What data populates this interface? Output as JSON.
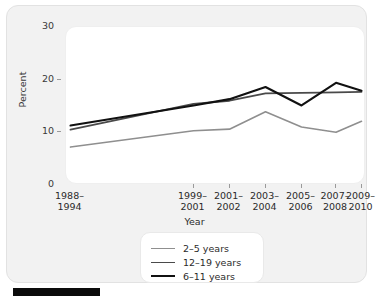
{
  "chart_data": {
    "type": "line",
    "title": "",
    "xlabel": "Year",
    "ylabel": "Percent",
    "ylim": [
      0,
      30
    ],
    "yticks": [
      0,
      10,
      20,
      30
    ],
    "ytick_labels": [
      "0",
      "10",
      "20",
      "30"
    ],
    "grid": false,
    "legend_position": "bottom-center",
    "categories": [
      "1988–1994",
      "1999–2001",
      "2001–2002",
      "2003–2004",
      "2005–2006",
      "2007–2008",
      "2009–2010"
    ],
    "category_lines": [
      [
        "1988–",
        "1994"
      ],
      [
        "1999–",
        "2001"
      ],
      [
        "2001–",
        "2002"
      ],
      [
        "2003–",
        "2004"
      ],
      [
        "2005–",
        "2006"
      ],
      [
        "2007–",
        "2008"
      ],
      [
        "2009–",
        "2010"
      ]
    ],
    "category_x_frac": [
      0.015,
      0.425,
      0.545,
      0.665,
      0.785,
      0.9,
      0.985
    ],
    "series": [
      {
        "name": "2–5 years",
        "color": "#8f8f8f",
        "width": 1.6,
        "values": [
          7.2,
          10.3,
          10.6,
          13.9,
          11.0,
          10.0,
          12.1
        ]
      },
      {
        "name": "12–19 years",
        "color": "#4a4a4a",
        "width": 1.8,
        "values": [
          10.5,
          15.4,
          16.0,
          17.4,
          17.5,
          17.6,
          17.7
        ]
      },
      {
        "name": "6–11 years",
        "color": "#111111",
        "width": 2.1,
        "values": [
          11.3,
          15.1,
          16.3,
          18.6,
          15.1,
          19.4,
          17.9
        ]
      }
    ]
  },
  "legend": {
    "entries": [
      {
        "label": "2–5 years",
        "color": "#8f8f8f",
        "width": 1.6
      },
      {
        "label": "12–19 years",
        "color": "#4a4a4a",
        "width": 1.8
      },
      {
        "label": "6–11 years",
        "color": "#111111",
        "width": 2.1
      }
    ]
  },
  "figure": {
    "panel_background": "#f2f2f2",
    "plot_background": "#ffffff",
    "bottom_bar_color": "#0b0b0b"
  }
}
